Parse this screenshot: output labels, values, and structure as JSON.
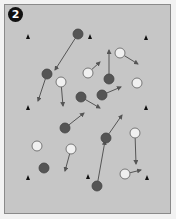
{
  "diagram": {
    "badge_label": "2",
    "colors": {
      "field": "#c6c6c6",
      "border": "#8a8a8a",
      "team_dark": "#555555",
      "team_light": "#f0f0f0",
      "cone": "#111111",
      "arrow": "#555555"
    },
    "cones": [
      {
        "x": 28,
        "y": 37
      },
      {
        "x": 90,
        "y": 37
      },
      {
        "x": 146,
        "y": 38
      },
      {
        "x": 28,
        "y": 108
      },
      {
        "x": 146,
        "y": 108
      },
      {
        "x": 28,
        "y": 178
      },
      {
        "x": 88,
        "y": 177
      },
      {
        "x": 147,
        "y": 178
      }
    ],
    "dark_players": [
      {
        "x": 78,
        "y": 34,
        "to": [
          55,
          70
        ]
      },
      {
        "x": 47,
        "y": 74,
        "to": [
          38,
          101
        ]
      },
      {
        "x": 81,
        "y": 97,
        "to": [
          100,
          108
        ]
      },
      {
        "x": 102,
        "y": 95,
        "to": [
          121,
          87
        ]
      },
      {
        "x": 109,
        "y": 79,
        "to": [
          109,
          50
        ]
      },
      {
        "x": 65,
        "y": 128,
        "to": [
          84,
          113
        ]
      },
      {
        "x": 106,
        "y": 138,
        "to": [
          122,
          115
        ]
      },
      {
        "x": 97,
        "y": 186,
        "to": [
          105,
          141
        ]
      },
      {
        "x": 44,
        "y": 168,
        "to": null
      }
    ],
    "light_players": [
      {
        "x": 61,
        "y": 82,
        "to": [
          63,
          106
        ]
      },
      {
        "x": 88,
        "y": 73,
        "to": [
          100,
          62
        ]
      },
      {
        "x": 120,
        "y": 53,
        "to": [
          138,
          64
        ]
      },
      {
        "x": 137,
        "y": 83,
        "to": null
      },
      {
        "x": 37,
        "y": 146,
        "to": null
      },
      {
        "x": 71,
        "y": 149,
        "to": [
          65,
          171
        ]
      },
      {
        "x": 135,
        "y": 133,
        "to": [
          136,
          164
        ]
      },
      {
        "x": 125,
        "y": 174,
        "to": [
          141,
          170
        ]
      }
    ],
    "extra_arrows": [
      {
        "from": [
          64,
          128
        ],
        "to": [
          53,
          148
        ]
      },
      {
        "from": [
          88,
          96
        ],
        "to": [
          85,
          112
        ]
      }
    ]
  }
}
